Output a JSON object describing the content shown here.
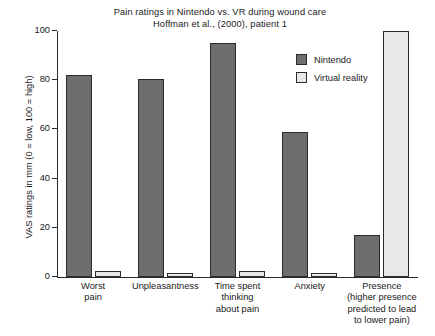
{
  "chart_data": {
    "type": "bar",
    "title": "Pain ratings in Nintendo vs. VR during wound care",
    "subtitle": "Hoffman et al., (2000), patient 1",
    "xlabel": "",
    "ylabel": "VAS ratings in mm (0 = low, 100 = high)",
    "ylim": [
      0,
      100
    ],
    "yticks": [
      0,
      20,
      40,
      60,
      80,
      100
    ],
    "ytick_labels": [
      "0",
      "20",
      "40",
      "60",
      "80",
      "100"
    ],
    "grid": false,
    "legend_position": "upper right",
    "categories": [
      "Worst\npain",
      "Unpleasantness",
      "Time spent\nthinking\nabout pain",
      "Anxiety",
      "Presence\n(higher presence\npredicted to lead\nto lower pain)"
    ],
    "category_lines": [
      [
        "Worst",
        "pain"
      ],
      [
        "Unpleasantness"
      ],
      [
        "Time spent",
        "thinking",
        "about pain"
      ],
      [
        "Anxiety"
      ],
      [
        "Presence",
        "(higher presence",
        "predicted to lead",
        "to lower pain)"
      ]
    ],
    "series": [
      {
        "name": "Nintendo",
        "color": "#6e6e6e",
        "values": [
          82,
          80.5,
          95,
          59,
          17
        ]
      },
      {
        "name": "Virtual reality",
        "color": "#e8e8e8",
        "values": [
          2.5,
          1.5,
          2.5,
          1.5,
          100
        ]
      }
    ]
  },
  "legend": {
    "items": [
      {
        "label": "Nintendo"
      },
      {
        "label": "Virtual reality"
      }
    ]
  },
  "colors": {
    "nintendo": "#6e6e6e",
    "virtual_reality": "#e8e8e8",
    "axis": "#2b2b2b",
    "background": "#ffffff"
  }
}
